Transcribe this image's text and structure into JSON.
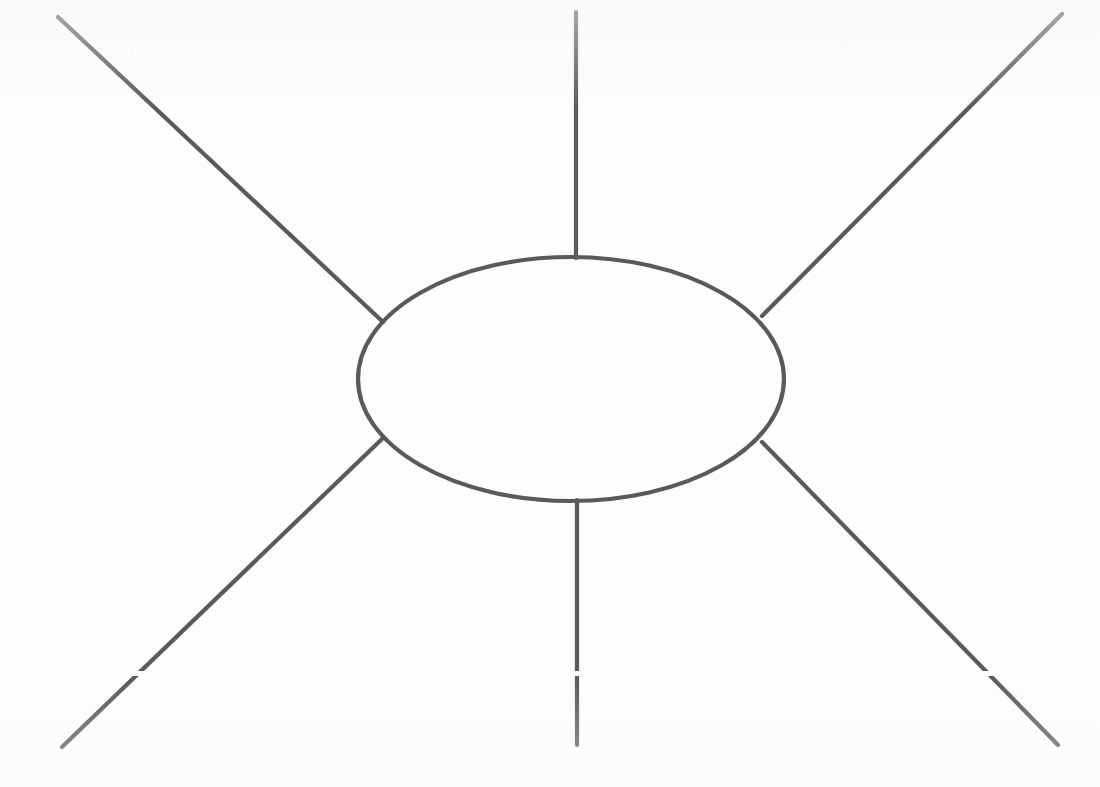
{
  "figure": {
    "kind": "scanned-line-drawing",
    "canvas": {
      "width": 1100,
      "height": 787
    },
    "background_color": "#fdfdfc",
    "stroke_color": "#5a5a5a",
    "stroke_width": 4.2,
    "ellipse": {
      "name": "central-blob",
      "center_x": 571,
      "center_y": 379,
      "radius_x": 213,
      "radius_y": 122,
      "fill": "none"
    },
    "lines": [
      {
        "name": "upper-left-leg",
        "x1": 58,
        "y1": 17,
        "x2": 383,
        "y2": 322
      },
      {
        "name": "upper-right-leg",
        "x1": 1062,
        "y1": 14,
        "x2": 762,
        "y2": 316
      },
      {
        "name": "lower-left-leg",
        "x1": 62,
        "y1": 747,
        "x2": 383,
        "y2": 438
      },
      {
        "name": "lower-right-leg",
        "x1": 1058,
        "y1": 745,
        "x2": 762,
        "y2": 442
      },
      {
        "name": "top-vertical-leg",
        "x1": 576,
        "y1": 12,
        "x2": 576,
        "y2": 258
      },
      {
        "name": "bottom-vertical-leg",
        "x1": 577,
        "y1": 500,
        "x2": 577,
        "y2": 745
      }
    ],
    "artifacts": [
      {
        "name": "scan-dropout-band",
        "y": 671,
        "height": 5,
        "color": "#fdfdfc"
      }
    ]
  }
}
